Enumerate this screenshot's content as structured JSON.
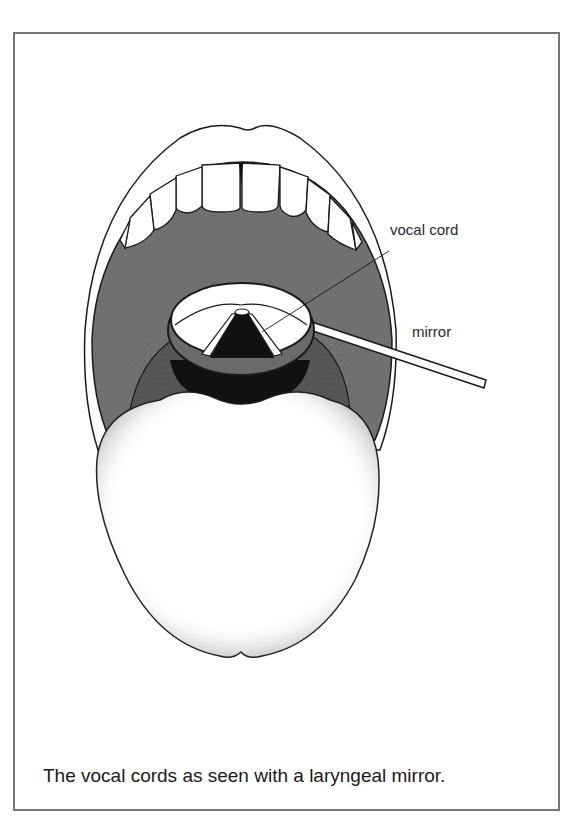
{
  "figure": {
    "labels": {
      "vocal_cord": "vocal cord",
      "mirror": "mirror"
    },
    "caption": "The vocal cords as seen with a laryngeal mirror.",
    "colors": {
      "frame": "#777777",
      "mouth_cavity": "#707070",
      "throat_dark": "#111111",
      "outline": "#1a1a1a",
      "background": "#ffffff"
    }
  }
}
